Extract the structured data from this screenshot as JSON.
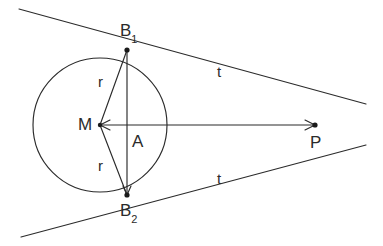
{
  "figure": {
    "type": "geometry-diagram",
    "background_color": "#ffffff",
    "stroke_color": "#2b2b2b"
  },
  "points": {
    "M": {
      "label": "M",
      "x": 100,
      "y": 125,
      "role": "circle-center",
      "label_x": 78,
      "label_y": 116
    },
    "A": {
      "label": "A",
      "x": 127,
      "y": 125,
      "role": "chord-midpoint",
      "label_x": 132,
      "label_y": 133
    },
    "B1": {
      "label": "B",
      "subscript": "1",
      "x": 127,
      "y": 50,
      "role": "tangent-point-upper",
      "label_x": 120,
      "label_y": 22
    },
    "B2": {
      "label": "B",
      "subscript": "2",
      "x": 127,
      "y": 195,
      "role": "tangent-point-lower",
      "label_x": 120,
      "label_y": 202
    },
    "P": {
      "label": "P",
      "x": 315,
      "y": 125,
      "role": "external-point",
      "label_x": 310,
      "label_y": 134
    }
  },
  "circle": {
    "center_x": 100,
    "center_y": 125,
    "radius": 67
  },
  "segments": {
    "radius_upper": {
      "label": "r",
      "from": "M",
      "to": "B1",
      "label_x": 98,
      "label_y": 74
    },
    "radius_lower": {
      "label": "r",
      "from": "M",
      "to": "B2",
      "label_x": 98,
      "label_y": 158
    },
    "tangent_upper": {
      "label": "t",
      "from": "B1",
      "to": "P",
      "label_x": 217,
      "label_y": 64
    },
    "tangent_lower": {
      "label": "t",
      "from": "B2",
      "to": "P",
      "label_x": 217,
      "label_y": 171
    },
    "axis": {
      "label": "",
      "from": "M",
      "to": "P"
    },
    "chord": {
      "label": "",
      "from": "B1",
      "to": "B2"
    }
  },
  "lines": {
    "tangent_upper_extended": {
      "x1": 19,
      "y1": 9,
      "x2": 366,
      "y2": 104
    },
    "tangent_lower_extended": {
      "x1": 21,
      "y1": 237,
      "x2": 366,
      "y2": 145
    }
  },
  "labels_list": [
    {
      "text": "B",
      "sub": "1"
    },
    {
      "text": "B",
      "sub": "2"
    },
    {
      "text": "M",
      "sub": ""
    },
    {
      "text": "A",
      "sub": ""
    },
    {
      "text": "P",
      "sub": ""
    },
    {
      "text": "r",
      "sub": ""
    },
    {
      "text": "r",
      "sub": ""
    },
    {
      "text": "t",
      "sub": ""
    },
    {
      "text": "t",
      "sub": ""
    }
  ]
}
